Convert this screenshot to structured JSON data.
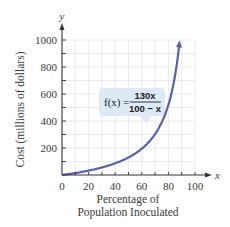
{
  "chart_data": {
    "type": "line",
    "title": "",
    "xlabel": "Percentage of Population Inoculated",
    "xlabel_lines": [
      "Percentage of",
      "Population Inoculated"
    ],
    "ylabel": "Cost (millions of dollars)",
    "x_axis_var": "x",
    "y_axis_var": "y",
    "xlim": [
      0,
      100
    ],
    "ylim": [
      0,
      1000
    ],
    "x_ticks": [
      0,
      20,
      40,
      60,
      80,
      100
    ],
    "x_tick_labels": [
      "0",
      "20",
      "40",
      "60",
      "80",
      "100"
    ],
    "y_ticks": [
      200,
      400,
      600,
      800,
      1000
    ],
    "y_tick_labels": [
      "200",
      "400",
      "600",
      "800",
      "1000"
    ],
    "grid": true,
    "grid_step_x": 10,
    "grid_step_y": 100,
    "series": [
      {
        "name": "f(x) = 130x / (100 − x)",
        "function": "130x/(100-x)",
        "color": "#5a5fb0",
        "x": [
          0,
          10,
          20,
          30,
          40,
          50,
          60,
          70,
          80,
          85,
          88
        ],
        "values": [
          0,
          14.4,
          32.5,
          55.7,
          86.7,
          130,
          195,
          303.3,
          520,
          736.7,
          953.3
        ],
        "end_arrow": true
      }
    ],
    "annotations": [
      {
        "text_lhs": "f(x) =",
        "numerator": "130x",
        "denominator": "100 − x",
        "box_color": "#dde9f5",
        "points_to_x": 73
      }
    ]
  },
  "colors": {
    "grid": "#e2e6ee",
    "axis": "#333333",
    "curve": "#5a5fb0",
    "callout": "#dde9f5",
    "text": "#3a3a3a"
  }
}
